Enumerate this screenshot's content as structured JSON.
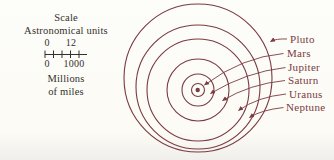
{
  "legend": {
    "title": "Scale",
    "subtitle": "Astronomical units",
    "au_scale": {
      "min": "0",
      "max": "12"
    },
    "miles_scale": {
      "min": "0",
      "max": "1000"
    },
    "miles_unit_line1": "Millions",
    "miles_unit_line2": "of miles"
  },
  "diagram": {
    "planets": [
      {
        "name": "Pluto"
      },
      {
        "name": "Mars"
      },
      {
        "name": "Jupiter"
      },
      {
        "name": "Saturn"
      },
      {
        "name": "Uranus"
      },
      {
        "name": "Neptune"
      }
    ],
    "rings_outer_to_inner": [
      "Pluto",
      "Neptune",
      "Uranus",
      "Saturn",
      "Jupiter",
      "Mars"
    ]
  },
  "colors": {
    "accent": "#7a3b41",
    "text": "#33302c",
    "background": "#fcfbf6"
  }
}
